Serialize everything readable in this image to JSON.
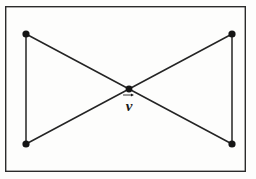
{
  "figure": {
    "background_color": "#fdfdfc",
    "ink_color": "#1f1f1f",
    "frame": {
      "name": "outer-frame",
      "x": 5,
      "y": 6,
      "width": 241,
      "height": 166,
      "stroke_color": "#2b2b2b",
      "stroke_width": 1.4
    },
    "vertices": [
      {
        "id": "top-left",
        "label": "",
        "x": 26,
        "y": 34,
        "radius": 3.6
      },
      {
        "id": "top-right",
        "label": "",
        "x": 232,
        "y": 34,
        "radius": 3.6
      },
      {
        "id": "bottom-left",
        "label": "",
        "x": 26,
        "y": 144,
        "radius": 3.6
      },
      {
        "id": "bottom-right",
        "label": "",
        "x": 232,
        "y": 144,
        "radius": 3.6
      },
      {
        "id": "center",
        "label": "v",
        "x": 129,
        "y": 89,
        "radius": 3.4
      }
    ],
    "edges": [
      {
        "id": "left-vertical",
        "from": "top-left",
        "to": "bottom-left",
        "x1": 26,
        "y1": 34,
        "x2": 26,
        "y2": 144
      },
      {
        "id": "right-vertical",
        "from": "top-right",
        "to": "bottom-right",
        "x1": 232,
        "y1": 34,
        "x2": 232,
        "y2": 144
      },
      {
        "id": "diagonal-tl-to-br",
        "from": "top-left",
        "to": "bottom-right",
        "x1": 26,
        "y1": 34,
        "x2": 232,
        "y2": 144
      },
      {
        "id": "diagonal-bl-to-tr",
        "from": "bottom-left",
        "to": "top-right",
        "x1": 26,
        "y1": 144,
        "x2": 232,
        "y2": 34
      }
    ],
    "label": {
      "text": "v",
      "accent": "vector-arrow",
      "x": 129,
      "y": 94,
      "font_size": 15
    }
  }
}
